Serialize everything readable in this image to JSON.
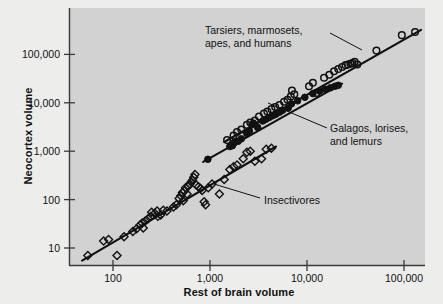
{
  "chart_data": {
    "type": "scatter",
    "title": "",
    "xlabel": "Rest of brain volume",
    "ylabel": "Neocortex volume",
    "xscale": "log",
    "yscale": "log",
    "xlim": [
      45,
      200000
    ],
    "ylim": [
      5,
      400000
    ],
    "grid": false,
    "legend_position": "inline-annotations",
    "xticks": [
      "100",
      "1,000",
      "10,000",
      "100,000"
    ],
    "xtick_values": [
      100,
      1000,
      10000,
      100000
    ],
    "yticks": [
      "10",
      "100",
      "1,000",
      "10,000",
      "100,000"
    ],
    "ytick_values": [
      10,
      100,
      1000,
      10000,
      100000
    ],
    "series": [
      {
        "name": "Tarsiers, marmosets, apes, and humans",
        "marker": "open-circle",
        "color": "#111111",
        "points": [
          [
            1500,
            1700
          ],
          [
            1750,
            2100
          ],
          [
            1900,
            2500
          ],
          [
            2100,
            2800
          ],
          [
            2400,
            3500
          ],
          [
            2600,
            3900
          ],
          [
            2900,
            4300
          ],
          [
            3200,
            5200
          ],
          [
            3600,
            6000
          ],
          [
            3900,
            6600
          ],
          [
            4300,
            7400
          ],
          [
            4700,
            8200
          ],
          [
            5200,
            9000
          ],
          [
            5800,
            10500
          ],
          [
            6300,
            11500
          ],
          [
            6800,
            13500
          ],
          [
            7400,
            15000
          ],
          [
            7000,
            18000
          ],
          [
            10500,
            22000
          ],
          [
            11500,
            26000
          ],
          [
            12500,
            16000
          ],
          [
            15000,
            33000
          ],
          [
            17000,
            38000
          ],
          [
            19000,
            45000
          ],
          [
            21000,
            50000
          ],
          [
            23000,
            55000
          ],
          [
            25000,
            60000
          ],
          [
            26500,
            62000
          ],
          [
            28000,
            64000
          ],
          [
            29500,
            66000
          ],
          [
            31000,
            70000
          ],
          [
            33000,
            62000
          ],
          [
            52000,
            120000
          ],
          [
            95000,
            250000
          ],
          [
            130000,
            290000
          ]
        ]
      },
      {
        "name": "Galagos, lorises, and lemurs",
        "marker": "filled-circle",
        "color": "#111111",
        "points": [
          [
            950,
            680
          ],
          [
            1600,
            1250
          ],
          [
            1700,
            1300
          ],
          [
            1750,
            1450
          ],
          [
            1800,
            1550
          ],
          [
            1950,
            1600
          ],
          [
            2100,
            1800
          ],
          [
            2400,
            2300
          ],
          [
            2550,
            2600
          ],
          [
            2700,
            3500
          ],
          [
            2800,
            3800
          ],
          [
            3100,
            3100
          ],
          [
            3500,
            4200
          ],
          [
            3800,
            4600
          ],
          [
            4100,
            5000
          ],
          [
            4400,
            5400
          ],
          [
            4700,
            5700
          ],
          [
            4900,
            6100
          ],
          [
            5200,
            6400
          ],
          [
            5600,
            7000
          ],
          [
            6400,
            7800
          ],
          [
            6900,
            9500
          ],
          [
            8000,
            11000
          ],
          [
            9500,
            13000
          ],
          [
            11500,
            15500
          ],
          [
            13500,
            17500
          ],
          [
            15500,
            19000
          ],
          [
            17500,
            20500
          ],
          [
            19500,
            22000
          ],
          [
            21000,
            23000
          ]
        ]
      },
      {
        "name": "Insectivores",
        "marker": "open-diamond",
        "color": "#111111",
        "points": [
          [
            55,
            7
          ],
          [
            80,
            14
          ],
          [
            90,
            15
          ],
          [
            110,
            7
          ],
          [
            130,
            17
          ],
          [
            160,
            22
          ],
          [
            175,
            25
          ],
          [
            190,
            30
          ],
          [
            200,
            33
          ],
          [
            205,
            26
          ],
          [
            215,
            36
          ],
          [
            230,
            40
          ],
          [
            245,
            45
          ],
          [
            250,
            55
          ],
          [
            270,
            52
          ],
          [
            285,
            58
          ],
          [
            290,
            45
          ],
          [
            310,
            48
          ],
          [
            330,
            60
          ],
          [
            360,
            58
          ],
          [
            420,
            70
          ],
          [
            450,
            78
          ],
          [
            480,
            105
          ],
          [
            500,
            120
          ],
          [
            520,
            140
          ],
          [
            530,
            95
          ],
          [
            545,
            150
          ],
          [
            560,
            175
          ],
          [
            580,
            130
          ],
          [
            600,
            190
          ],
          [
            620,
            210
          ],
          [
            640,
            230
          ],
          [
            660,
            250
          ],
          [
            680,
            290
          ],
          [
            700,
            330
          ],
          [
            720,
            200
          ],
          [
            760,
            185
          ],
          [
            800,
            170
          ],
          [
            830,
            155
          ],
          [
            870,
            90
          ],
          [
            900,
            78
          ],
          [
            960,
            175
          ],
          [
            1050,
            210
          ],
          [
            1250,
            130
          ],
          [
            1400,
            260
          ],
          [
            1600,
            420
          ],
          [
            1750,
            480
          ],
          [
            1900,
            520
          ],
          [
            2200,
            700
          ],
          [
            2400,
            950
          ],
          [
            2600,
            1000
          ],
          [
            2900,
            620
          ],
          [
            3400,
            700
          ],
          [
            3800,
            1100
          ],
          [
            4300,
            1150
          ]
        ]
      }
    ],
    "fit_lines": [
      {
        "name": "anthropoid-fit",
        "x": [
          1400,
          150000
        ],
        "y": [
          1550,
          320000
        ]
      },
      {
        "name": "prosimian-fit",
        "x": [
          850,
          23000
        ],
        "y": [
          600,
          25000
        ]
      },
      {
        "name": "insectivore-fit",
        "x": [
          48,
          4800
        ],
        "y": [
          5.5,
          1250
        ]
      }
    ],
    "annotations": [
      {
        "id": "anthropoid-label",
        "lines": [
          "Tarsiers, marmosets,",
          "apes, and humans"
        ],
        "text_x": 205,
        "text_y": 24,
        "leader": [
          [
            330,
            33
          ],
          [
            362,
            50
          ]
        ]
      },
      {
        "id": "prosimian-label",
        "lines": [
          "Galagos, lorises,",
          "and lemurs"
        ],
        "text_x": 330,
        "text_y": 122,
        "leader": [
          [
            327,
            128
          ],
          [
            268,
            103
          ]
        ]
      },
      {
        "id": "insectivore-label",
        "lines": [
          "Insectivores"
        ],
        "text_x": 264,
        "text_y": 194,
        "leader": [
          [
            260,
            198
          ],
          [
            214,
            184
          ]
        ]
      }
    ],
    "colors": {
      "plot_background": "#d2d2d2",
      "page_background": "#ededec",
      "axis": "#3a3a3a",
      "marker": "#111111"
    }
  }
}
